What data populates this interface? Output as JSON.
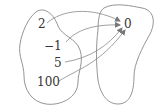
{
  "diagram": {
    "type": "function-mapping",
    "domain_set": {
      "elements": [
        {
          "label": "2",
          "x": 38,
          "y": 18
        },
        {
          "label": "−1",
          "x": 44,
          "y": 40
        },
        {
          "label": "5",
          "x": 54,
          "y": 57
        },
        {
          "label": "100",
          "x": 37,
          "y": 76
        }
      ]
    },
    "codomain_set": {
      "elements": [
        {
          "label": "0",
          "x": 124,
          "y": 18
        }
      ]
    },
    "mappings": [
      {
        "from": "2",
        "to": "0"
      },
      {
        "from": "−1",
        "to": "0"
      },
      {
        "from": "5",
        "to": "0"
      },
      {
        "from": "100",
        "to": "0"
      }
    ],
    "stroke_color": "#888888",
    "text_color": "#333333"
  }
}
